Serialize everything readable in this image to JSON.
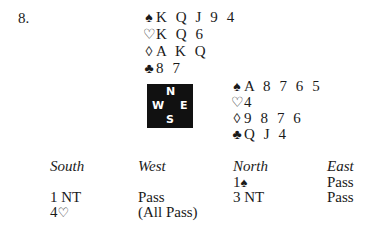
{
  "problem": {
    "number": "8."
  },
  "north_hand": {
    "spades": {
      "symbol": "♠",
      "cards": "K Q J 9 4"
    },
    "hearts": {
      "symbol": "♡",
      "cards": "K Q 6"
    },
    "diamonds": {
      "symbol": "◊",
      "cards": "A K Q"
    },
    "clubs": {
      "symbol": "♣",
      "cards": "8 7"
    }
  },
  "compass": {
    "north": "N",
    "west": "W",
    "east": "E",
    "south": "S",
    "background": "#111111"
  },
  "east_hand": {
    "spades": {
      "symbol": "♠",
      "cards": "A 8 7 6 5"
    },
    "hearts": {
      "symbol": "♡",
      "cards": "4"
    },
    "diamonds": {
      "symbol": "◊",
      "cards": "9 8 7 6"
    },
    "clubs": {
      "symbol": "♣",
      "cards": "Q J 4"
    }
  },
  "auction": {
    "headers": {
      "south": "South",
      "west": "West",
      "north": "North",
      "east": "East"
    },
    "rows": [
      {
        "south": "",
        "west": "",
        "north_level": "1",
        "north_suit": "♠",
        "east": "Pass"
      },
      {
        "south": "1 NT",
        "west": "Pass",
        "north": "3 NT",
        "east": "Pass"
      },
      {
        "south_level": "4",
        "south_suit": "♡",
        "west": "(All Pass)",
        "north": "",
        "east": ""
      }
    ]
  }
}
